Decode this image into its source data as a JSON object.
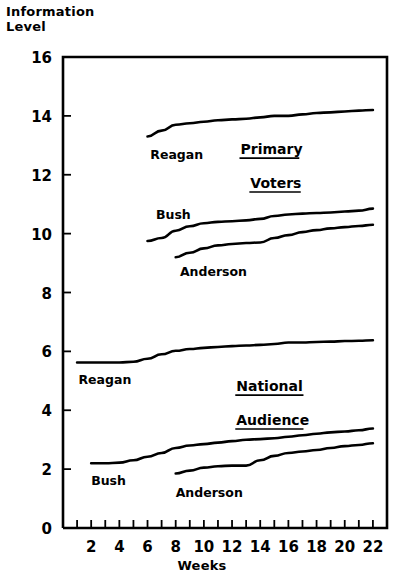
{
  "chart_data": {
    "type": "line",
    "title": "",
    "xlabel": "Weeks",
    "ylabel": "Information\nLevel",
    "ylabel_line1": "Information",
    "ylabel_line2": "Level",
    "xlim": [
      0,
      23
    ],
    "ylim": [
      0,
      16
    ],
    "grid": false,
    "legend": "inline-annotations",
    "x_ticks": [
      1,
      2,
      3,
      4,
      5,
      6,
      7,
      8,
      9,
      10,
      11,
      12,
      13,
      14,
      15,
      16,
      17,
      18,
      19,
      20,
      21,
      22
    ],
    "x_tick_labels": [
      "2",
      "4",
      "6",
      "8",
      "10",
      "12",
      "14",
      "16",
      "18",
      "20",
      "22"
    ],
    "x_tick_label_values": [
      2,
      4,
      6,
      8,
      10,
      12,
      14,
      16,
      18,
      20,
      22
    ],
    "y_ticks": [
      0,
      2,
      4,
      6,
      8,
      10,
      12,
      14,
      16
    ],
    "y_tick_labels": [
      "0",
      "2",
      "4",
      "6",
      "8",
      "10",
      "12",
      "14",
      "16"
    ],
    "groups": [
      {
        "name": "Primary Voters",
        "label_line1": "Primary",
        "label_line2": "Voters",
        "underlined": true
      },
      {
        "name": "National Audience",
        "label_line1": "National",
        "label_line2": "Audience",
        "underlined": true
      }
    ],
    "series": [
      {
        "name": "Reagan",
        "group": "Primary Voters",
        "x": [
          6,
          7,
          8,
          9,
          10,
          11,
          12,
          13,
          14,
          15,
          16,
          17,
          18,
          19,
          20,
          21,
          22
        ],
        "values": [
          13.3,
          13.5,
          13.7,
          13.75,
          13.8,
          13.85,
          13.88,
          13.9,
          13.95,
          14.0,
          14.0,
          14.05,
          14.1,
          14.12,
          14.15,
          14.18,
          14.2
        ]
      },
      {
        "name": "Bush",
        "group": "Primary Voters",
        "x": [
          6,
          7,
          8,
          9,
          10,
          11,
          12,
          13,
          14,
          15,
          16,
          17,
          18,
          19,
          20,
          21,
          22
        ],
        "values": [
          9.75,
          9.85,
          10.1,
          10.25,
          10.35,
          10.4,
          10.42,
          10.45,
          10.5,
          10.6,
          10.65,
          10.68,
          10.7,
          10.72,
          10.75,
          10.78,
          10.85
        ]
      },
      {
        "name": "Anderson",
        "group": "Primary Voters",
        "x": [
          8,
          9,
          10,
          11,
          12,
          13,
          14,
          15,
          16,
          17,
          18,
          19,
          20,
          21,
          22
        ],
        "values": [
          9.2,
          9.35,
          9.5,
          9.6,
          9.65,
          9.68,
          9.7,
          9.85,
          9.95,
          10.05,
          10.12,
          10.18,
          10.22,
          10.26,
          10.3
        ]
      },
      {
        "name": "Reagan",
        "group": "National Audience",
        "x": [
          1,
          2,
          3,
          4,
          5,
          6,
          7,
          8,
          9,
          10,
          11,
          12,
          13,
          14,
          15,
          16,
          17,
          18,
          19,
          20,
          21,
          22
        ],
        "values": [
          5.62,
          5.62,
          5.62,
          5.62,
          5.65,
          5.75,
          5.9,
          6.02,
          6.08,
          6.12,
          6.15,
          6.18,
          6.2,
          6.22,
          6.25,
          6.3,
          6.3,
          6.32,
          6.33,
          6.35,
          6.36,
          6.38
        ]
      },
      {
        "name": "Bush",
        "group": "National Audience",
        "x": [
          2,
          3,
          4,
          5,
          6,
          7,
          8,
          9,
          10,
          11,
          12,
          13,
          14,
          15,
          16,
          17,
          18,
          19,
          20,
          21,
          22
        ],
        "values": [
          2.2,
          2.2,
          2.22,
          2.3,
          2.42,
          2.55,
          2.72,
          2.8,
          2.85,
          2.9,
          2.95,
          3.0,
          3.02,
          3.05,
          3.1,
          3.15,
          3.2,
          3.25,
          3.28,
          3.32,
          3.38
        ]
      },
      {
        "name": "Anderson",
        "group": "National Audience",
        "x": [
          8,
          9,
          10,
          11,
          12,
          13,
          14,
          15,
          16,
          17,
          18,
          19,
          20,
          21,
          22
        ],
        "values": [
          1.85,
          1.95,
          2.05,
          2.1,
          2.12,
          2.12,
          2.3,
          2.45,
          2.55,
          2.6,
          2.65,
          2.72,
          2.78,
          2.82,
          2.88
        ]
      }
    ],
    "annotations": [
      {
        "text": "Reagan",
        "x": 6.2,
        "y": 12.55
      },
      {
        "text": "Primary",
        "x": 12.6,
        "y": 12.7
      },
      {
        "text": "Voters",
        "x": 13.3,
        "y": 11.55
      },
      {
        "text": "Bush",
        "x": 6.6,
        "y": 10.5
      },
      {
        "text": "Anderson",
        "x": 8.3,
        "y": 8.55
      },
      {
        "text": "Reagan",
        "x": 1.1,
        "y": 4.9
      },
      {
        "text": "National",
        "x": 12.3,
        "y": 4.65
      },
      {
        "text": "Audience",
        "x": 12.3,
        "y": 3.5
      },
      {
        "text": "Bush",
        "x": 2.0,
        "y": 1.45
      },
      {
        "text": "Anderson",
        "x": 8.0,
        "y": 1.05
      }
    ]
  }
}
